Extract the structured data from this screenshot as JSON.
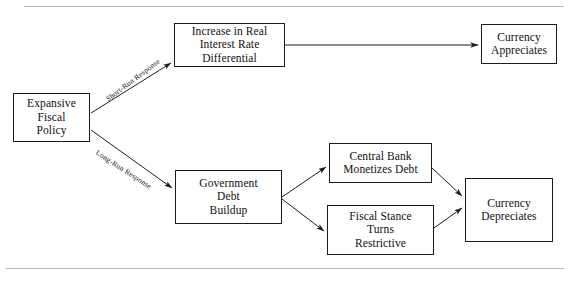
{
  "figure": {
    "title_fragment": "",
    "top_rule": "horizontal-rule",
    "bottom_rule": "horizontal-rule"
  },
  "diagram": {
    "type": "flowchart",
    "nodes": [
      {
        "id": "expansive-fiscal-policy",
        "label": "Expansive\nFiscal\nPolicy"
      },
      {
        "id": "interest-rate-differential",
        "label": "Increase in Real\nInterest Rate\nDifferential"
      },
      {
        "id": "currency-appreciates",
        "label": "Currency\nAppreciates"
      },
      {
        "id": "government-debt-buildup",
        "label": "Government\nDebt\nBuildup"
      },
      {
        "id": "central-bank-monetizes-debt",
        "label": "Central Bank\nMonetizes Debt"
      },
      {
        "id": "fiscal-stance-restrictive",
        "label": "Fiscal Stance\nTurns\nRestrictive"
      },
      {
        "id": "currency-depreciates",
        "label": "Currency\nDepreciates"
      }
    ],
    "edges": [
      {
        "from": "expansive-fiscal-policy",
        "to": "interest-rate-differential",
        "label": "Short-Run Response"
      },
      {
        "from": "expansive-fiscal-policy",
        "to": "government-debt-buildup",
        "label": "Long-Run Response"
      },
      {
        "from": "interest-rate-differential",
        "to": "currency-appreciates",
        "label": ""
      },
      {
        "from": "government-debt-buildup",
        "to": "central-bank-monetizes-debt",
        "label": ""
      },
      {
        "from": "government-debt-buildup",
        "to": "fiscal-stance-restrictive",
        "label": ""
      },
      {
        "from": "central-bank-monetizes-debt",
        "to": "currency-depreciates",
        "label": ""
      },
      {
        "from": "fiscal-stance-restrictive",
        "to": "currency-depreciates",
        "label": ""
      }
    ],
    "colors": {
      "box_border": "#1c1c1c",
      "box_fill": "#ffffff",
      "arrow": "#1c1c1c",
      "text": "#0f0f0f",
      "rule": "#b9b9b9"
    }
  }
}
